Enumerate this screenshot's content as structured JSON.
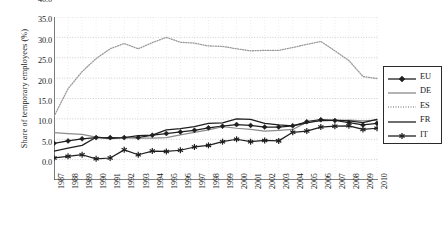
{
  "chart_data": {
    "type": "line",
    "title": "",
    "xlabel": "",
    "ylabel": "Share of temporary employees (%)",
    "ylim": [
      0,
      40
    ],
    "ytick_labels": [
      "0.0",
      "5.0",
      "10.0",
      "15.0",
      "20.0",
      "25.0",
      "30.0",
      "35.0",
      "40.0"
    ],
    "ytick_values": [
      0,
      5,
      10,
      15,
      20,
      25,
      30,
      35,
      40
    ],
    "grid": true,
    "legend_position": "right",
    "categories": [
      "1987",
      "1988",
      "1989",
      "1990",
      "1991",
      "1992",
      "1993",
      "1994",
      "1995",
      "1996",
      "1997",
      "1998",
      "1999",
      "2000",
      "2001",
      "2002",
      "2003",
      "2004",
      "2005",
      "2006",
      "2007",
      "2008",
      "2009",
      "2010"
    ],
    "series": [
      {
        "name": "EU",
        "marker": "diamond",
        "style": "solid",
        "color": "#1f1f1f",
        "values": [
          9.0,
          9.6,
          10.1,
          10.4,
          10.4,
          10.4,
          10.4,
          11.0,
          11.4,
          11.8,
          12.2,
          12.8,
          13.2,
          13.6,
          13.4,
          13.0,
          13.0,
          13.3,
          14.3,
          14.8,
          14.6,
          14.1,
          13.5,
          13.9
        ]
      },
      {
        "name": "DE",
        "marker": "none",
        "style": "solid",
        "color": "#8c8c8c",
        "values": [
          11.6,
          11.4,
          11.2,
          10.5,
          10.1,
          10.5,
          10.3,
          10.3,
          10.4,
          11.1,
          11.7,
          12.3,
          13.1,
          12.7,
          12.4,
          12.0,
          12.2,
          12.4,
          14.2,
          14.5,
          14.6,
          14.7,
          14.5,
          14.7
        ]
      },
      {
        "name": "ES",
        "marker": "none",
        "style": "dotted",
        "color": "#9a9a9a",
        "values": [
          15.6,
          22.4,
          26.6,
          29.8,
          32.2,
          33.5,
          32.2,
          33.7,
          35.0,
          33.8,
          33.6,
          32.9,
          32.8,
          32.2,
          31.7,
          31.8,
          31.8,
          32.5,
          33.3,
          34.0,
          31.7,
          29.3,
          25.4,
          24.9
        ]
      },
      {
        "name": "FR",
        "marker": "none",
        "style": "solid",
        "color": "#1f1f1f",
        "values": [
          7.1,
          7.8,
          8.5,
          10.5,
          10.2,
          10.4,
          10.9,
          11.0,
          12.3,
          12.6,
          13.1,
          13.9,
          14.0,
          15.0,
          14.9,
          13.9,
          13.5,
          13.3,
          14.0,
          14.6,
          14.7,
          14.5,
          14.1,
          14.9
        ]
      },
      {
        "name": "IT",
        "marker": "asterisk",
        "style": "solid",
        "color": "#1f1f1f",
        "values": [
          5.4,
          5.8,
          6.2,
          5.2,
          5.4,
          7.4,
          6.2,
          7.1,
          7.0,
          7.3,
          8.1,
          8.5,
          9.4,
          10.0,
          9.4,
          9.7,
          9.6,
          11.7,
          12.0,
          13.0,
          13.2,
          13.3,
          12.4,
          12.7
        ]
      }
    ]
  },
  "legend": {
    "entries": [
      {
        "label": "EU"
      },
      {
        "label": "DE"
      },
      {
        "label": "ES"
      },
      {
        "label": "FR"
      },
      {
        "label": "IT"
      }
    ]
  }
}
